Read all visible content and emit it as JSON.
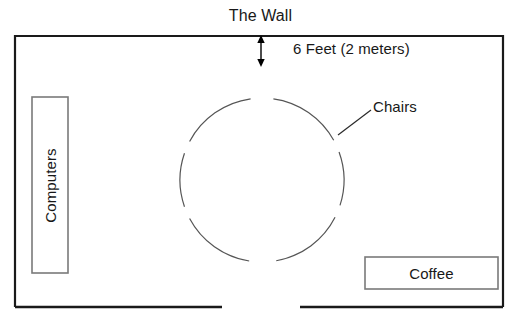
{
  "diagram": {
    "title": "The Wall",
    "labels": {
      "wall": "The Wall",
      "distance": "6 Feet (2 meters)",
      "chairs": "Chairs",
      "computers": "Computers",
      "coffee": "Coffee"
    },
    "colors": {
      "room_outline": "#1a1a1a",
      "box_outline": "#7a7a7a",
      "arc": "#555555",
      "arrow": "#000000",
      "background": "#ffffff",
      "text": "#181818"
    },
    "geometry": {
      "room": {
        "x": 15,
        "y": 36,
        "width": 488,
        "height": 271
      },
      "door_gap": {
        "start_x": 222,
        "end_x": 300
      },
      "circle": {
        "cx": 262,
        "cy": 180,
        "r": 82
      },
      "arrow": {
        "x": 261,
        "y_top": 36,
        "y_bottom": 66
      },
      "computers_box": {
        "x": 32,
        "y": 97,
        "width": 36,
        "height": 176
      },
      "coffee_box": {
        "x": 365,
        "y": 257,
        "width": 133,
        "height": 32
      }
    }
  }
}
